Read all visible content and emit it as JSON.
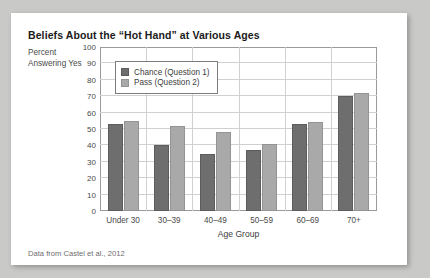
{
  "figure": {
    "title": "Beliefs About the “Hot Hand” at Various Ages",
    "ylabel": "Percent Answering Yes",
    "source": "Data from Castel et al., 2012"
  },
  "legend": {
    "items": [
      {
        "label": "Chance (Question 1)",
        "color": "#6e6e6e"
      },
      {
        "label": "Pass (Question 2)",
        "color": "#a9a9a9"
      }
    ]
  },
  "chart_data": {
    "type": "bar",
    "title": "Beliefs About the “Hot Hand” at Various Ages",
    "xlabel": "Age Group",
    "ylabel": "Percent Answering Yes",
    "categories": [
      "Under 30",
      "30–39",
      "40–49",
      "50–59",
      "60–69",
      "70+"
    ],
    "series": [
      {
        "name": "Chance (Question 1)",
        "color": "#6e6e6e",
        "values": [
          53,
          40,
          35,
          37,
          53,
          70
        ]
      },
      {
        "name": "Pass (Question 2)",
        "color": "#a9a9a9",
        "values": [
          55,
          52,
          48,
          41,
          54,
          72
        ]
      }
    ],
    "ylim": [
      0,
      100
    ],
    "yticks": [
      0,
      10,
      20,
      30,
      40,
      50,
      60,
      70,
      80,
      90,
      100
    ],
    "grid": true,
    "legend_position": "upper left"
  }
}
